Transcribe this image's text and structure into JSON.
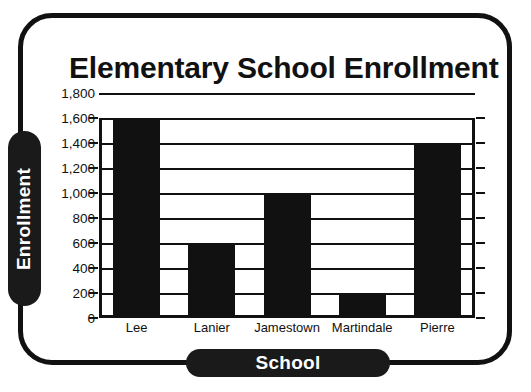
{
  "chart_data": {
    "type": "bar",
    "title": "Elementary School Enrollment",
    "xlabel": "School",
    "ylabel": "Enrollment",
    "categories": [
      "Lee",
      "Lanier",
      "Jamestown",
      "Martindale",
      "Pierre"
    ],
    "values": [
      1600,
      600,
      1000,
      200,
      1400
    ],
    "ylim": [
      0,
      1800
    ],
    "ytick_step": 200,
    "ytick_labels": [
      "1,800",
      "1,600",
      "1,400",
      "1,200",
      "1,000",
      "800",
      "600",
      "400",
      "200",
      "0"
    ],
    "ytick_values": [
      1800,
      1600,
      1400,
      1200,
      1000,
      800,
      600,
      400,
      200,
      0
    ],
    "grid": true,
    "legend": false,
    "bar_color": "#111111",
    "background_color": "#ffffff",
    "axis_label_pill_color": "#1a1a1a",
    "axis_label_text_color": "#ffffff"
  }
}
